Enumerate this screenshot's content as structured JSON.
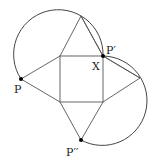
{
  "diagram": {
    "colors": {
      "stroke": "#555555",
      "arc": "#444444",
      "point": "#000000",
      "background": "#ffffff"
    },
    "labels": {
      "P": "P",
      "P_prime": "P′",
      "X": "X",
      "P_double_prime": "P′′"
    },
    "points": {
      "P": [
        21,
        79
      ],
      "P_prime": [
        103,
        56
      ],
      "P_double_prime": [
        81,
        140
      ],
      "square": [
        [
          60,
          56
        ],
        [
          103,
          56
        ],
        [
          103,
          102
        ],
        [
          60,
          102
        ]
      ],
      "triangle_top_apex": [
        81,
        16
      ],
      "triangle_right_apex": [
        140,
        78
      ]
    }
  }
}
